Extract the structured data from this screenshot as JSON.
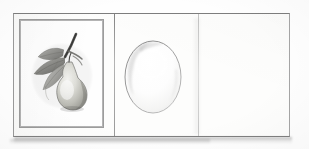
{
  "document": {
    "type": "scanned-sketchbook-page",
    "medium": "graphite pencil on paper",
    "panel_count": 3,
    "paper_color": "#fdfdfc",
    "background_color": "#ffffff",
    "border_color": "#8f8f8f"
  },
  "panels": [
    {
      "index": 1,
      "name": "pear-botanical-drawing",
      "label": "Pear with leaves on branch",
      "state": "drawn",
      "has_frame": true,
      "frame_style": "double-ruled rectangle",
      "subject": "pear fruit with three leaves and a stem",
      "shading": "graphite, highlight on upper-left of fruit",
      "ink_color": "#6d6d6d"
    },
    {
      "index": 2,
      "name": "egg-oval-study",
      "label": "Shaded oval / egg study",
      "state": "outlined",
      "has_frame": false,
      "subject": "vertical ovoid outline with soft interior shading",
      "shading": "light tone along upper-left rim",
      "ink_color": "#8a8a8a"
    },
    {
      "index": 3,
      "name": "blank-panel",
      "label": "Blank panel",
      "state": "empty",
      "has_frame": false,
      "subject": "",
      "shading": "clean paper",
      "ink_color": "#ffffff"
    }
  ],
  "marks": {
    "fold_lines": 2,
    "base_shadow": "soft gray shadow along the bottom edge",
    "smudge": "faint vertical smudge beside the right fold"
  },
  "colors": {
    "graphite_dark": "#4a4a4a",
    "graphite_mid": "#8c8c8c",
    "graphite_light": "#c9c9c9",
    "paper": "#fdfdfc",
    "rule": "#9c9c9c"
  }
}
